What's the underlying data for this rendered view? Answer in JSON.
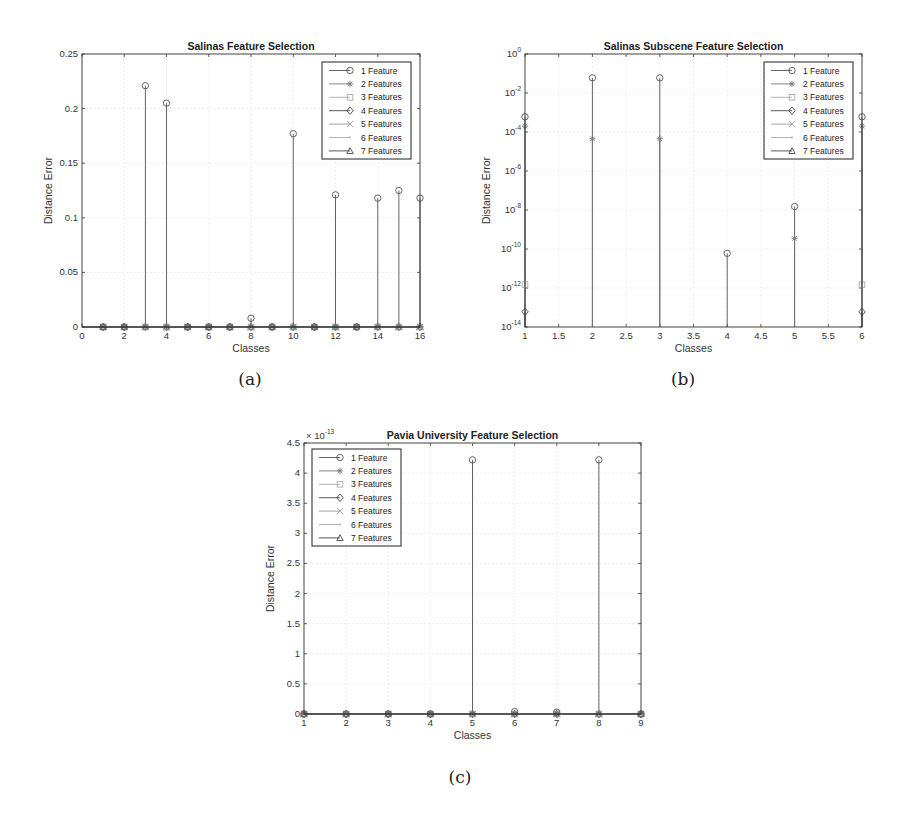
{
  "figure": {
    "captions": [
      "(a)",
      "(b)",
      "(c)"
    ]
  },
  "legend_entries": [
    "1 Feature",
    "2 Features",
    "3 Features",
    "4 Features",
    "5 Features",
    "6 Features",
    "7 Features"
  ],
  "legend_markers": [
    "circle",
    "asterisk",
    "square",
    "diamond",
    "x",
    "point",
    "triangle"
  ],
  "legend_colors": [
    "#555555",
    "#777777",
    "#aaaaaa",
    "#444444",
    "#999999",
    "#aaaaaa",
    "#444444"
  ],
  "chart_data": [
    {
      "id": "a",
      "type": "stem",
      "title": "Salinas Feature Selection",
      "xlabel": "Classes",
      "ylabel": "Distance Error",
      "xlim": [
        0,
        16
      ],
      "ylim": [
        0,
        0.25
      ],
      "yscale": "linear",
      "xticks": [
        0,
        2,
        4,
        6,
        8,
        10,
        12,
        14,
        16
      ],
      "yticks": [
        0,
        0.05,
        0.1,
        0.15,
        0.2,
        0.25
      ],
      "ytick_labels": [
        "0",
        "0.05",
        "0.1",
        "0.15",
        "0.2",
        "0.25"
      ],
      "grid": true,
      "legend_position": "upper right",
      "x": [
        1,
        2,
        3,
        4,
        5,
        6,
        7,
        8,
        9,
        10,
        11,
        12,
        13,
        14,
        15,
        16
      ],
      "series": [
        {
          "name": "1 Feature",
          "values": [
            0,
            0,
            0.221,
            0.205,
            0,
            0,
            0,
            0.008,
            0,
            0.177,
            0,
            0.121,
            0,
            0.118,
            0.125,
            0.118
          ]
        },
        {
          "name": "2 Features",
          "values": [
            0,
            0,
            0,
            0,
            0,
            0,
            0,
            0,
            0,
            0,
            0,
            0,
            0,
            0,
            0,
            0
          ]
        },
        {
          "name": "3 Features",
          "values": [
            0,
            0,
            0,
            0,
            0,
            0,
            0,
            0,
            0,
            0,
            0,
            0,
            0,
            0,
            0,
            0
          ]
        },
        {
          "name": "4 Features",
          "values": [
            0,
            0,
            0,
            0,
            0,
            0,
            0,
            0,
            0,
            0,
            0,
            0,
            0,
            0,
            0,
            0
          ]
        },
        {
          "name": "5 Features",
          "values": [
            0,
            0,
            0,
            0,
            0,
            0,
            0,
            0,
            0,
            0,
            0,
            0,
            0,
            0,
            0,
            0
          ]
        },
        {
          "name": "6 Features",
          "values": [
            0,
            0,
            0,
            0,
            0,
            0,
            0,
            0,
            0,
            0,
            0,
            0,
            0,
            0,
            0,
            0
          ]
        },
        {
          "name": "7 Features",
          "values": [
            0,
            0,
            0,
            0,
            0,
            0,
            0,
            0,
            0,
            0,
            0,
            0,
            0,
            0,
            0,
            0
          ]
        }
      ]
    },
    {
      "id": "b",
      "type": "stem",
      "title": "Salinas Subscene Feature Selection",
      "xlabel": "Classes",
      "ylabel": "Distance Error",
      "xlim": [
        1,
        6
      ],
      "ylim": [
        1e-14,
        1
      ],
      "yscale": "log",
      "xticks": [
        1,
        1.5,
        2,
        2.5,
        3,
        3.5,
        4,
        4.5,
        5,
        5.5,
        6
      ],
      "yticks_exp": [
        0,
        -2,
        -4,
        -6,
        -8,
        -10,
        -12,
        -14
      ],
      "grid": true,
      "legend_position": "upper right",
      "x": [
        1,
        2,
        3,
        4,
        5,
        6
      ],
      "series": [
        {
          "name": "1 Feature",
          "values": [
            0.0006,
            0.06,
            0.06,
            6e-11,
            1.5e-08,
            0.0006
          ]
        },
        {
          "name": "2 Features",
          "values": [
            0.0002,
            4.5e-05,
            4.5e-05,
            null,
            3.5e-10,
            0.0002
          ]
        },
        {
          "name": "3 Features",
          "values": [
            1.5e-12,
            null,
            null,
            null,
            null,
            1.5e-12
          ]
        },
        {
          "name": "4 Features",
          "values": [
            6e-14,
            null,
            null,
            null,
            null,
            6e-14
          ]
        },
        {
          "name": "5 Features",
          "values": [
            null,
            null,
            null,
            null,
            null,
            null
          ]
        },
        {
          "name": "6 Features",
          "values": [
            null,
            null,
            null,
            null,
            null,
            null
          ]
        },
        {
          "name": "7 Features",
          "values": [
            null,
            null,
            null,
            null,
            null,
            null
          ]
        }
      ]
    },
    {
      "id": "c",
      "type": "stem",
      "title": "Pavia University Feature Selection",
      "xlabel": "Classes",
      "ylabel": "Distance Error",
      "xlim": [
        1,
        9
      ],
      "ylim": [
        0,
        4.5
      ],
      "y_multiplier": "× 10",
      "y_multiplier_exp": "-13",
      "yscale": "linear",
      "xticks": [
        1,
        2,
        3,
        4,
        5,
        6,
        7,
        8,
        9
      ],
      "yticks": [
        0,
        0.5,
        1,
        1.5,
        2,
        2.5,
        3,
        3.5,
        4,
        4.5
      ],
      "ytick_labels": [
        "0",
        "0.5",
        "1",
        "1.5",
        "2",
        "2.5",
        "3",
        "3.5",
        "4",
        "4.5"
      ],
      "grid": true,
      "legend_position": "upper left",
      "x": [
        1,
        2,
        3,
        4,
        5,
        6,
        7,
        8,
        9
      ],
      "series": [
        {
          "name": "1 Feature",
          "values": [
            0,
            0,
            0,
            0,
            4.22,
            0.04,
            0.03,
            4.22,
            0
          ]
        },
        {
          "name": "2 Features",
          "values": [
            0,
            0,
            0,
            0,
            0,
            0,
            0,
            0,
            0
          ]
        },
        {
          "name": "3 Features",
          "values": [
            0,
            0,
            0,
            0,
            0,
            0,
            0,
            0,
            0
          ]
        },
        {
          "name": "4 Features",
          "values": [
            0,
            0,
            0,
            0,
            0,
            0,
            0,
            0,
            0
          ]
        },
        {
          "name": "5 Features",
          "values": [
            0,
            0,
            0,
            0,
            0,
            0,
            0,
            0,
            0
          ]
        },
        {
          "name": "6 Features",
          "values": [
            0,
            0,
            0,
            0,
            0,
            0,
            0,
            0,
            0
          ]
        },
        {
          "name": "7 Features",
          "values": [
            0,
            0,
            0,
            0,
            0,
            0,
            0,
            0,
            0
          ]
        }
      ]
    }
  ]
}
